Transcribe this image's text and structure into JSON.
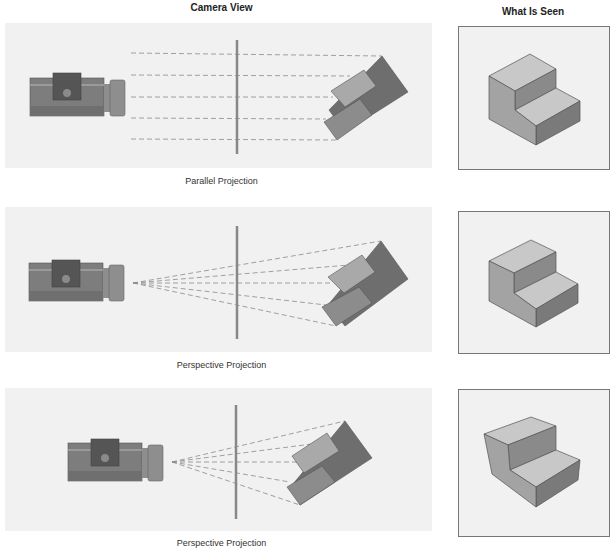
{
  "headers": {
    "camera_view": "Camera View",
    "what_is_seen": "What Is Seen"
  },
  "rows": [
    {
      "id": "parallel",
      "caption": "Parallel Projection",
      "projection_type": "parallel"
    },
    {
      "id": "perspective-1",
      "caption": "Perspective Projection",
      "projection_type": "perspective"
    },
    {
      "id": "perspective-2",
      "caption": "Perspective Projection",
      "projection_type": "perspective"
    }
  ],
  "colors": {
    "panel_bg": "#f1f1f1",
    "camera_body": "#7d7d7d",
    "camera_top": "#555555",
    "lens": "#8e8e8e",
    "picture_plane": "#888888",
    "object_light": "#a9a9a9",
    "object_mid": "#8c8c8c",
    "object_dark": "#6e6e6e",
    "ray": "#8a8a8a",
    "box_border": "#777777"
  }
}
